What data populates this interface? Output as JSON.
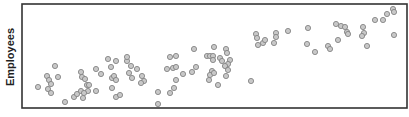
{
  "chart_data": {
    "type": "scatter",
    "title": "",
    "xlabel": "",
    "ylabel": "Employees",
    "grid": false,
    "legend": null,
    "frame": {
      "left": 22,
      "top": 4,
      "right": 407,
      "bottom": 108
    },
    "marker": {
      "radius": 2.6,
      "fill": "#c8c8c8",
      "stroke": "#858585"
    },
    "points": [
      [
        38,
        87
      ],
      [
        47,
        76
      ],
      [
        49,
        80
      ],
      [
        51,
        84
      ],
      [
        48,
        89
      ],
      [
        51,
        93
      ],
      [
        55,
        66
      ],
      [
        58,
        77
      ],
      [
        65,
        102
      ],
      [
        74,
        97
      ],
      [
        77,
        94
      ],
      [
        81,
        91
      ],
      [
        83,
        98
      ],
      [
        81,
        72
      ],
      [
        82,
        77
      ],
      [
        85,
        79
      ],
      [
        87,
        85
      ],
      [
        89,
        85
      ],
      [
        88,
        91
      ],
      [
        84,
        93
      ],
      [
        96,
        69
      ],
      [
        101,
        74
      ],
      [
        96,
        91
      ],
      [
        108,
        59
      ],
      [
        116,
        61
      ],
      [
        111,
        67
      ],
      [
        112,
        78
      ],
      [
        114,
        76
      ],
      [
        116,
        80
      ],
      [
        112,
        88
      ],
      [
        116,
        97
      ],
      [
        120,
        95
      ],
      [
        127,
        61
      ],
      [
        129,
        73
      ],
      [
        127,
        57
      ],
      [
        131,
        66
      ],
      [
        137,
        69
      ],
      [
        132,
        78
      ],
      [
        142,
        76
      ],
      [
        144,
        81
      ],
      [
        141,
        83
      ],
      [
        158,
        92
      ],
      [
        170,
        57
      ],
      [
        176,
        56
      ],
      [
        167,
        69
      ],
      [
        173,
        68
      ],
      [
        176,
        67
      ],
      [
        176,
        80
      ],
      [
        183,
        74
      ],
      [
        170,
        93
      ],
      [
        174,
        88
      ],
      [
        158,
        104
      ],
      [
        194,
        49
      ],
      [
        192,
        72
      ],
      [
        196,
        67
      ],
      [
        207,
        56
      ],
      [
        210,
        56
      ],
      [
        213,
        56
      ],
      [
        214,
        47
      ],
      [
        213,
        60
      ],
      [
        220,
        58
      ],
      [
        226,
        49
      ],
      [
        227,
        53
      ],
      [
        222,
        61
      ],
      [
        230,
        60
      ],
      [
        228,
        64
      ],
      [
        225,
        66
      ],
      [
        212,
        71
      ],
      [
        210,
        75
      ],
      [
        214,
        73
      ],
      [
        209,
        80
      ],
      [
        226,
        76
      ],
      [
        228,
        70
      ],
      [
        218,
        85
      ],
      [
        256,
        34
      ],
      [
        257,
        38
      ],
      [
        263,
        43
      ],
      [
        265,
        40
      ],
      [
        258,
        45
      ],
      [
        276,
        33
      ],
      [
        276,
        37
      ],
      [
        274,
        43
      ],
      [
        288,
        31
      ],
      [
        251,
        81
      ],
      [
        308,
        28
      ],
      [
        307,
        44
      ],
      [
        315,
        52
      ],
      [
        328,
        46
      ],
      [
        330,
        49
      ],
      [
        338,
        40
      ],
      [
        336,
        24
      ],
      [
        341,
        26
      ],
      [
        345,
        27
      ],
      [
        347,
        32
      ],
      [
        348,
        34
      ],
      [
        363,
        27
      ],
      [
        364,
        33
      ],
      [
        362,
        36
      ],
      [
        367,
        46
      ],
      [
        375,
        20
      ],
      [
        383,
        20
      ],
      [
        387,
        14
      ],
      [
        393,
        9
      ],
      [
        394,
        12
      ],
      [
        394,
        35
      ]
    ]
  }
}
